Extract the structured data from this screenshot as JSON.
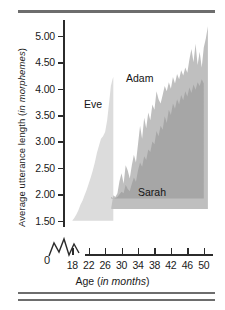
{
  "figure": {
    "rules": [
      "top-rule",
      "bottom-rule-1",
      "bottom-rule-2"
    ]
  },
  "axes": {
    "ylabel_main": "Average utterance length (",
    "ylabel_italic": "in morphemes",
    "ylabel_close": ")",
    "xlabel_main": "Age (",
    "xlabel_italic": "in months",
    "xlabel_close": ")",
    "zero_label": "0"
  },
  "chart_data": {
    "type": "area",
    "title": "",
    "xlabel": "Age (in months)",
    "ylabel": "Average utterance length (in morphemes)",
    "xlim": [
      16,
      52
    ],
    "ylim": [
      1.4,
      5.3
    ],
    "y_axis_break": true,
    "y_break_from": 0,
    "y_break_to": 1.5,
    "grid": false,
    "legend": "inline-annotations",
    "xticks": [
      18,
      22,
      26,
      30,
      34,
      38,
      42,
      46,
      50
    ],
    "xtick_labels": [
      "18",
      "22",
      "26",
      "30",
      "34",
      "38",
      "42",
      "46",
      "50"
    ],
    "yticks": [
      1.5,
      2.0,
      2.5,
      3.0,
      3.5,
      4.0,
      4.5,
      5.0
    ],
    "ytick_labels": [
      "1.50",
      "2.00",
      "2.50",
      "3.00",
      "3.50",
      "4.00",
      "4.50",
      "5.00"
    ],
    "colors": {
      "eve": "#dcdcdc",
      "adam": "#bfbfbf",
      "sarah": "#a6a6a6",
      "axis": "#2b2b2b",
      "rule": "#6d6d6d"
    },
    "series": [
      {
        "name": "Eve",
        "color": "#dcdcdc",
        "baseline": 1.5,
        "x": [
          18.0,
          18.5,
          19.0,
          19.5,
          20.0,
          20.5,
          21.0,
          21.5,
          22.0,
          22.5,
          23.0,
          23.5,
          24.0,
          24.5,
          25.0,
          25.5,
          26.0,
          26.5,
          27.0,
          27.4,
          27.8,
          28.0
        ],
        "values": [
          1.5,
          1.55,
          1.62,
          1.7,
          1.8,
          1.88,
          1.98,
          2.08,
          2.2,
          2.32,
          2.45,
          2.6,
          2.78,
          2.92,
          3.05,
          3.1,
          3.18,
          3.4,
          3.75,
          4.05,
          4.18,
          4.22
        ]
      },
      {
        "name": "Adam",
        "color": "#bfbfbf",
        "baseline": 1.72,
        "x": [
          27.5,
          28.0,
          28.5,
          29.0,
          29.5,
          30.0,
          30.5,
          31.0,
          31.5,
          32.0,
          32.5,
          33.0,
          33.5,
          34.0,
          34.5,
          35.0,
          35.5,
          36.0,
          36.5,
          37.0,
          37.5,
          38.0,
          38.5,
          39.0,
          39.5,
          40.0,
          40.5,
          41.0,
          41.5,
          42.0,
          42.5,
          43.0,
          43.5,
          44.0,
          44.5,
          45.0,
          45.5,
          46.0,
          46.5,
          47.0,
          47.5,
          48.0,
          48.5,
          49.0,
          49.5,
          50.0,
          50.5,
          51.0
        ],
        "values": [
          1.75,
          1.98,
          1.95,
          2.02,
          2.25,
          2.4,
          2.2,
          2.55,
          2.45,
          2.3,
          2.55,
          2.75,
          2.6,
          2.95,
          3.3,
          3.05,
          3.45,
          3.25,
          3.55,
          3.4,
          3.7,
          3.6,
          3.95,
          3.8,
          3.72,
          3.88,
          4.05,
          3.95,
          4.12,
          4.0,
          4.22,
          4.1,
          4.28,
          4.18,
          4.35,
          4.25,
          4.4,
          4.3,
          4.55,
          4.75,
          4.5,
          4.85,
          4.45,
          4.7,
          4.4,
          4.78,
          4.95,
          5.18
        ]
      },
      {
        "name": "Sarah",
        "color": "#a6a6a6",
        "baseline": 1.92,
        "x": [
          27.5,
          28.0,
          28.5,
          29.0,
          29.5,
          30.0,
          30.5,
          31.0,
          31.5,
          32.0,
          32.5,
          33.0,
          33.5,
          34.0,
          34.5,
          35.0,
          35.5,
          36.0,
          36.5,
          37.0,
          37.5,
          38.0,
          38.5,
          39.0,
          39.5,
          40.0,
          40.5,
          41.0,
          41.5,
          42.0,
          42.5,
          43.0,
          43.5,
          44.0,
          44.5,
          45.0,
          45.5,
          46.0,
          46.5,
          47.0,
          47.5,
          48.0,
          48.5,
          49.0,
          49.5,
          50.0
        ],
        "values": [
          1.95,
          1.92,
          1.93,
          1.95,
          2.0,
          2.05,
          2.02,
          2.18,
          2.1,
          2.06,
          2.2,
          2.32,
          2.24,
          2.45,
          2.6,
          2.52,
          2.72,
          2.65,
          2.85,
          2.8,
          3.0,
          2.95,
          3.2,
          3.1,
          3.3,
          3.22,
          3.48,
          3.35,
          3.6,
          3.5,
          3.72,
          3.62,
          3.8,
          3.7,
          3.88,
          3.78,
          3.95,
          3.85,
          4.02,
          3.92,
          4.08,
          3.98,
          4.12,
          4.05,
          4.18,
          4.1
        ]
      }
    ],
    "annotations": [
      {
        "text": "Eve",
        "x": 24.5,
        "y": 4.05
      },
      {
        "text": "Adam",
        "x": 36.0,
        "y": 4.55
      },
      {
        "text": "Sarah",
        "x": 41.0,
        "y": 2.35
      }
    ]
  }
}
